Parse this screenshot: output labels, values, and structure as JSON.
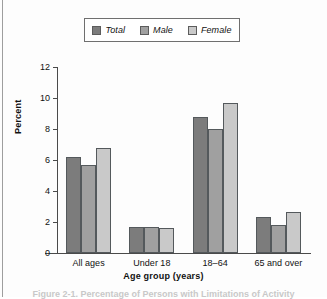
{
  "legend": {
    "items": [
      {
        "label": "Total",
        "color": "#7c7c7c"
      },
      {
        "label": "Male",
        "color": "#a0a0a0"
      },
      {
        "label": "Female",
        "color": "#c9c9c9"
      }
    ]
  },
  "axis": {
    "y_ticks": [
      "0",
      "2",
      "4",
      "6",
      "8",
      "10",
      "12"
    ],
    "y_title": "Percent",
    "x_title": "Age group (years)"
  },
  "caption": {
    "text": "Figure 2-1. Percentage of Persons with Limitations of Activity"
  },
  "chart_data": {
    "type": "bar",
    "title": "",
    "xlabel": "Age group (years)",
    "ylabel": "Percent",
    "ylim": [
      0,
      12
    ],
    "ytick_step": 2,
    "grid": false,
    "legend_position": "top-center",
    "categories": [
      "All ages",
      "Under 18",
      "18–64",
      "65 and over"
    ],
    "series": [
      {
        "name": "Total",
        "color": "#7c7c7c",
        "values": [
          6.2,
          1.65,
          8.8,
          2.3
        ]
      },
      {
        "name": "Male",
        "color": "#a0a0a0",
        "values": [
          5.7,
          1.65,
          8.0,
          1.8
        ]
      },
      {
        "name": "Female",
        "color": "#c9c9c9",
        "values": [
          6.8,
          1.6,
          9.65,
          2.65
        ]
      }
    ]
  }
}
